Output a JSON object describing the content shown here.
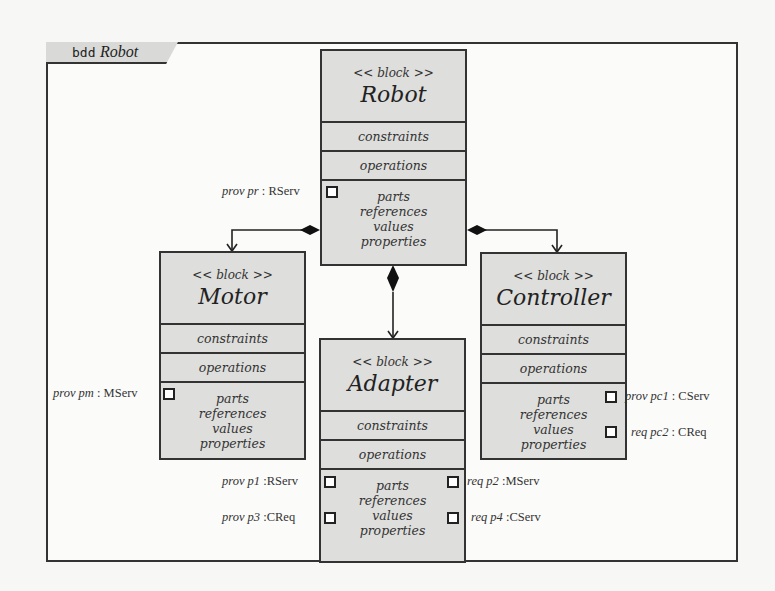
{
  "frame": {
    "keyword": "bdd",
    "name": "Robot"
  },
  "blocks": {
    "robot": {
      "stereotype": "<< block >>",
      "name": "Robot",
      "compartments": [
        "constraints",
        "operations"
      ],
      "body": [
        "parts",
        "references",
        "values",
        "properties"
      ],
      "ports": [
        {
          "direction": "prov",
          "name": "pr",
          "type": ": RServ",
          "side": "left"
        }
      ]
    },
    "motor": {
      "stereotype": "<< block >>",
      "name": "Motor",
      "compartments": [
        "constraints",
        "operations"
      ],
      "body": [
        "parts",
        "references",
        "values",
        "properties"
      ],
      "ports": [
        {
          "direction": "prov",
          "name": "pm",
          "type": ": MServ",
          "side": "left"
        }
      ]
    },
    "controller": {
      "stereotype": "<< block >>",
      "name": "Controller",
      "compartments": [
        "constraints",
        "operations"
      ],
      "body": [
        "parts",
        "references",
        "values",
        "properties"
      ],
      "ports": [
        {
          "direction": "prov",
          "name": "pc1",
          "type": ": CServ",
          "side": "right"
        },
        {
          "direction": "req",
          "name": "pc2",
          "type": ": CReq",
          "side": "right"
        }
      ]
    },
    "adapter": {
      "stereotype": "<< block >>",
      "name": "Adapter",
      "compartments": [
        "constraints",
        "operations"
      ],
      "body": [
        "parts",
        "references",
        "values",
        "properties"
      ],
      "ports": [
        {
          "direction": "prov",
          "name": "p1",
          "type": ":RServ",
          "side": "left"
        },
        {
          "direction": "prov",
          "name": "p3",
          "type": ":CReq",
          "side": "left"
        },
        {
          "direction": "req",
          "name": "p2",
          "type": ":MServ",
          "side": "right"
        },
        {
          "direction": "req",
          "name": "p4",
          "type": ":CServ",
          "side": "right"
        }
      ]
    }
  },
  "relations": [
    {
      "type": "composition",
      "from": "Robot",
      "to": "Motor"
    },
    {
      "type": "composition",
      "from": "Robot",
      "to": "Adapter"
    },
    {
      "type": "composition",
      "from": "Robot",
      "to": "Controller"
    }
  ],
  "colors": {
    "block_fill": "#dededc",
    "line": "#333333",
    "frame_bg": "#fbfbfa"
  }
}
